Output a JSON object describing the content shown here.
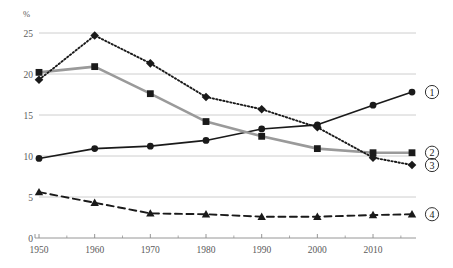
{
  "chart_data": {
    "type": "line",
    "title": "",
    "xlabel": "",
    "ylabel": "%",
    "ylim": [
      0,
      25
    ],
    "xlim": [
      1950,
      2017
    ],
    "grid": true,
    "legend_position": "right",
    "y_ticks": [
      "0",
      "5",
      "10",
      "15",
      "20",
      "25"
    ],
    "y_tick_values": [
      0,
      5,
      10,
      15,
      20,
      25
    ],
    "x_ticks": [
      "1950",
      "1960",
      "1970",
      "1980",
      "1990",
      "2000",
      "2010"
    ],
    "x_tick_values": [
      1950,
      1960,
      1970,
      1980,
      1990,
      2000,
      2010
    ],
    "x_minor_ticks": [
      1955,
      1965,
      1975,
      1985,
      1995,
      2005,
      2015
    ],
    "x": [
      1950,
      1960,
      1970,
      1980,
      1990,
      2000,
      2010,
      2017
    ],
    "series": [
      {
        "name": "1",
        "legend_label": "①",
        "marker": "circle",
        "line_style": "solid",
        "color": "#1a1a1a",
        "values": [
          9.7,
          10.9,
          11.2,
          11.9,
          13.3,
          13.8,
          16.2,
          17.8
        ]
      },
      {
        "name": "2",
        "legend_label": "②",
        "marker": "square",
        "line_style": "solid",
        "color": "#9a9a9a",
        "values": [
          20.2,
          20.9,
          17.6,
          14.2,
          12.4,
          10.9,
          10.4,
          10.4
        ]
      },
      {
        "name": "3",
        "legend_label": "③",
        "marker": "diamond",
        "line_style": "dotted",
        "color": "#1a1a1a",
        "values": [
          19.3,
          24.7,
          21.3,
          17.2,
          15.7,
          13.5,
          9.8,
          8.9
        ]
      },
      {
        "name": "4",
        "legend_label": "④",
        "marker": "triangle",
        "line_style": "dashed",
        "color": "#1a1a1a",
        "values": [
          5.6,
          4.3,
          3.0,
          2.9,
          2.6,
          2.6,
          2.8,
          2.9
        ]
      }
    ]
  },
  "legend": {
    "items": [
      {
        "label": "①",
        "name": "legend-marker-1"
      },
      {
        "label": "②",
        "name": "legend-marker-2"
      },
      {
        "label": "③",
        "name": "legend-marker-3"
      },
      {
        "label": "④",
        "name": "legend-marker-4"
      }
    ]
  },
  "axis": {
    "unit_label": "%"
  },
  "colors": {
    "grid": "#c8c8c8",
    "axis": "#8a8a8a",
    "series_dark": "#1a1a1a",
    "series_grey": "#9a9a9a",
    "tick_text": "#5a5a5a"
  }
}
